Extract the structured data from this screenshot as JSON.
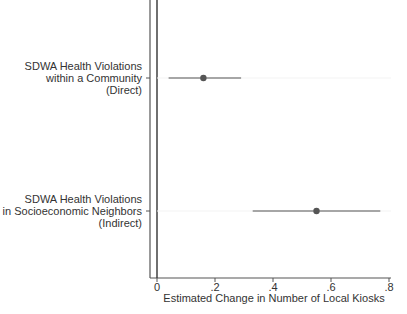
{
  "chart_data": {
    "type": "scatter",
    "subtype": "coefficient-plot",
    "title": "",
    "xlabel": "Estimated Change in Number of Local Kiosks",
    "ylabel": "",
    "xlim": [
      0,
      0.8
    ],
    "x_ticks": [
      0,
      0.2,
      0.4,
      0.6,
      0.8
    ],
    "x_tick_labels": [
      "0",
      ".2",
      ".4",
      ".6",
      ".8"
    ],
    "reference_line_x": 0,
    "grid": false,
    "legend": null,
    "categories": [
      "SDWA Health Violations within a Community (Direct)",
      "SDWA Health Violations in Socioeconomic Neighbors (Indirect)"
    ],
    "series": [
      {
        "name": "Estimate",
        "points": [
          {
            "label_lines": [
              "SDWA Health Violations",
              "within a Community",
              "(Direct)"
            ],
            "estimate": 0.16,
            "ci_low": 0.04,
            "ci_high": 0.29
          },
          {
            "label_lines": [
              "SDWA Health Violations",
              "in Socioeconomic Neighbors",
              "(Indirect)"
            ],
            "estimate": 0.55,
            "ci_low": 0.33,
            "ci_high": 0.77
          }
        ]
      }
    ],
    "colors": {
      "marker": "#555555",
      "ci_line": "#8a8a8a",
      "axis": "#444444",
      "text": "#333333"
    }
  }
}
